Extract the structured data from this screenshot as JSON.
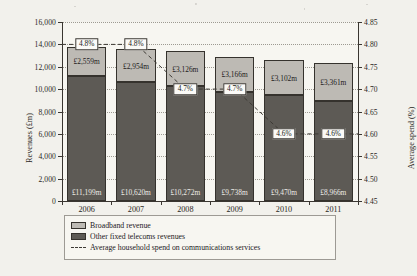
{
  "chart_data": {
    "type": "bar",
    "title": "",
    "subtitle": "",
    "xlabel": "",
    "ylabel": "Revenues (£m)",
    "y2label": "Average spend (%)",
    "categories": [
      "2006",
      "2007",
      "2008",
      "2009",
      "2010",
      "2011"
    ],
    "ylim": [
      0,
      16000
    ],
    "ytick_step": 2000,
    "yticks": [
      "0",
      "2,000",
      "4,000",
      "6,000",
      "8,000",
      "10,000",
      "12,000",
      "14,000",
      "16,000"
    ],
    "y2lim": [
      4.45,
      4.85
    ],
    "y2tick_step": 0.05,
    "y2ticks": [
      "4.45",
      "4.50",
      "4.55",
      "4.60",
      "4.65",
      "4.70",
      "4.75",
      "4.80",
      "4.85"
    ],
    "grid": true,
    "grid_style": "dotted-horizontal",
    "stacked": true,
    "legend_position": "bottom",
    "series": [
      {
        "name": "Other fixed telecoms revenues",
        "axis": "left",
        "kind": "bar-segment",
        "color": "#5d5a55",
        "values": [
          11199,
          10620,
          10272,
          9738,
          9470,
          8966
        ],
        "labels": [
          "£11,199m",
          "£10,620m",
          "£10,272m",
          "£9,738m",
          "£9,470m",
          "£8,966m"
        ]
      },
      {
        "name": "Broadband revenue",
        "axis": "left",
        "kind": "bar-segment",
        "color": "#bdbab4",
        "values": [
          2559,
          2954,
          3126,
          3166,
          3102,
          3361
        ],
        "labels": [
          "£2,559m",
          "£2,954m",
          "£3,126m",
          "£3,166m",
          "£3,102m",
          "£3,361m"
        ]
      },
      {
        "name": "Average household spend on communications services",
        "axis": "right",
        "kind": "line-dashed",
        "color": "#3d3a35",
        "values": [
          4.8,
          4.8,
          4.7,
          4.7,
          4.6,
          4.6
        ],
        "labels": [
          "4.8%",
          "4.8%",
          "4.7%",
          "4.7%",
          "4.6%",
          "4.6%"
        ]
      }
    ]
  },
  "legend": {
    "items": [
      {
        "label": "Broadband revenue",
        "swatch": "light-gray-square"
      },
      {
        "label": "Other fixed telecoms revenues",
        "swatch": "dark-gray-square"
      },
      {
        "label": "Average household spend on communications services",
        "swatch": "dashed-line"
      }
    ]
  }
}
